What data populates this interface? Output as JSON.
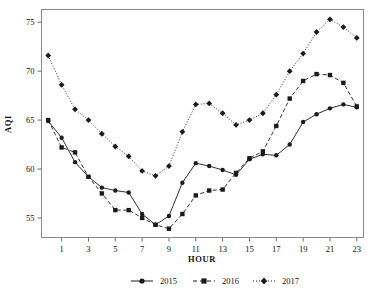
{
  "chart_data": {
    "type": "line",
    "title": "",
    "xlabel": "HOUR",
    "ylabel": "AQI",
    "x": [
      0,
      1,
      2,
      3,
      4,
      5,
      6,
      7,
      8,
      9,
      10,
      11,
      12,
      13,
      14,
      15,
      16,
      17,
      18,
      19,
      20,
      21,
      22,
      23
    ],
    "xlim": [
      -0.5,
      23.5
    ],
    "ylim": [
      53.0,
      76.3
    ],
    "xticks": [
      1,
      3,
      5,
      7,
      9,
      11,
      13,
      15,
      17,
      19,
      21,
      23
    ],
    "xtick_labels": [
      "1",
      "3",
      "5",
      "7",
      "9",
      "11",
      "13",
      "15",
      "17",
      "19",
      "21",
      "23"
    ],
    "yticks": [
      55,
      60,
      65,
      70,
      75
    ],
    "ytick_labels": [
      "55",
      "60",
      "65",
      "70",
      "75"
    ],
    "grid": false,
    "legend_position": "below",
    "series": [
      {
        "name": "2015",
        "marker": "circle",
        "linestyle": "solid",
        "color": "#1a1a1a",
        "values": [
          64.9,
          63.2,
          60.7,
          59.2,
          58.1,
          57.8,
          57.6,
          55.4,
          54.3,
          55.2,
          58.6,
          60.6,
          60.3,
          59.9,
          59.4,
          61.0,
          61.5,
          61.4,
          62.5,
          64.8,
          65.6,
          66.2,
          66.6,
          66.3
        ]
      },
      {
        "name": "2016",
        "marker": "square",
        "linestyle": "dashed",
        "color": "#1a1a1a",
        "values": [
          65.0,
          62.2,
          61.7,
          59.2,
          57.5,
          55.8,
          55.8,
          55.0,
          54.3,
          53.9,
          55.4,
          57.3,
          57.8,
          57.9,
          59.6,
          61.1,
          61.8,
          64.4,
          67.2,
          69.0,
          69.7,
          69.6,
          68.8,
          66.4
        ]
      },
      {
        "name": "2017",
        "marker": "diamond",
        "linestyle": "dotted",
        "color": "#1a1a1a",
        "values": [
          71.6,
          68.6,
          66.1,
          65.0,
          63.6,
          62.3,
          61.3,
          59.8,
          59.3,
          60.3,
          63.8,
          66.6,
          66.7,
          65.7,
          64.5,
          65.0,
          65.7,
          67.6,
          70.0,
          71.8,
          74.0,
          75.3,
          74.5,
          73.4
        ]
      }
    ]
  },
  "legend": {
    "items": [
      {
        "label": "2015"
      },
      {
        "label": "2016"
      },
      {
        "label": "2017"
      }
    ]
  }
}
